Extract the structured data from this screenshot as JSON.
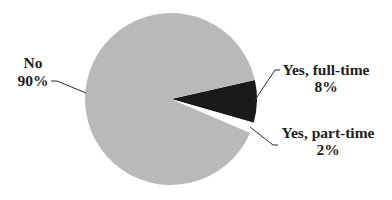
{
  "chart_data": {
    "type": "pie",
    "title": "",
    "slices": [
      {
        "label": "Yes, full-time",
        "value": 8,
        "display": "8%",
        "color": "#1a1a1a"
      },
      {
        "label": "Yes, part-time",
        "value": 2,
        "display": "2%",
        "color": "#ffffff"
      },
      {
        "label": "No",
        "value": 90,
        "display": "90%",
        "color": "#b9b9b9"
      }
    ],
    "start_angle_deg": -12.8,
    "direction": "clockwise",
    "legend": "none",
    "labels_position": "outside_with_leader_lines"
  },
  "labels": {
    "no": {
      "name": "No",
      "pct": "90%"
    },
    "full_time": {
      "name": "Yes, full-time",
      "pct": "8%"
    },
    "part_time": {
      "name": "Yes, part-time",
      "pct": "2%"
    }
  }
}
